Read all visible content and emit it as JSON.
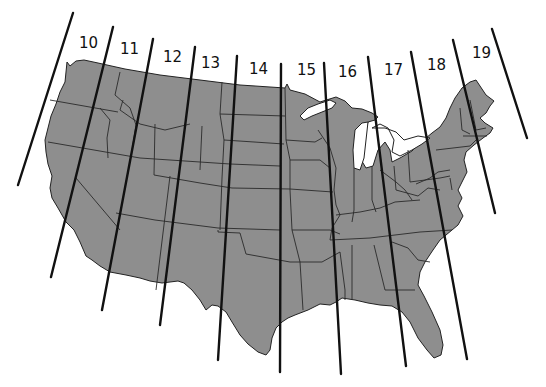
{
  "map": {
    "subject": "Contiguous United States with UTM zone boundaries",
    "fill_color": "#8e8e8e",
    "line_color": "#111111",
    "zones": [
      {
        "label": "10",
        "x": 79,
        "y": 48
      },
      {
        "label": "11",
        "x": 120,
        "y": 54
      },
      {
        "label": "12",
        "x": 163,
        "y": 62
      },
      {
        "label": "13",
        "x": 201,
        "y": 68
      },
      {
        "label": "14",
        "x": 249,
        "y": 74
      },
      {
        "label": "15",
        "x": 297,
        "y": 75
      },
      {
        "label": "16",
        "x": 338,
        "y": 77
      },
      {
        "label": "17",
        "x": 384,
        "y": 75
      },
      {
        "label": "18",
        "x": 427,
        "y": 70
      },
      {
        "label": "19",
        "x": 472,
        "y": 58
      }
    ],
    "boundaries": [
      {
        "x1": 73,
        "y1": 13,
        "x2": 18,
        "y2": 185
      },
      {
        "x1": 113,
        "y1": 27,
        "x2": 51,
        "y2": 277
      },
      {
        "x1": 153,
        "y1": 39,
        "x2": 102,
        "y2": 310
      },
      {
        "x1": 195,
        "y1": 47,
        "x2": 160,
        "y2": 325
      },
      {
        "x1": 237,
        "y1": 56,
        "x2": 218,
        "y2": 360
      },
      {
        "x1": 281,
        "y1": 64,
        "x2": 280,
        "y2": 372
      },
      {
        "x1": 324,
        "y1": 63,
        "x2": 341,
        "y2": 374
      },
      {
        "x1": 368,
        "y1": 57,
        "x2": 406,
        "y2": 366
      },
      {
        "x1": 411,
        "y1": 52,
        "x2": 467,
        "y2": 359
      },
      {
        "x1": 453,
        "y1": 40,
        "x2": 495,
        "y2": 213
      },
      {
        "x1": 492,
        "y1": 29,
        "x2": 527,
        "y2": 138
      }
    ]
  }
}
